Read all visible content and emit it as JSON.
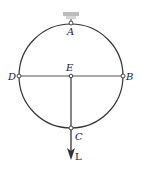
{
  "diagram": {
    "type": "ring-with-diametral-members",
    "labels": {
      "A": "A",
      "B": "B",
      "C": "C",
      "D": "D",
      "E": "E",
      "load": "L"
    },
    "colors": {
      "line": "#333333",
      "support": "#bfbfbf",
      "background": "#ffffff"
    }
  }
}
